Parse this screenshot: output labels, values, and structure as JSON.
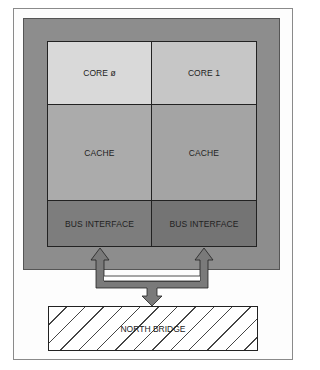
{
  "diagram": {
    "cores": [
      {
        "core_label": "CORE ø",
        "cache_label": "CACHE",
        "bus_label": "BUS INTERFACE"
      },
      {
        "core_label": "CORE 1",
        "cache_label": "CACHE",
        "bus_label": "BUS INTERFACE"
      }
    ],
    "north_bridge_label": "NORTH BRIDGE",
    "colors": {
      "chip_bg": "#8d8d8d",
      "core0": "#d9d9d9",
      "core1": "#c6c6c6",
      "cache0": "#ababab",
      "cache1": "#a4a4a4",
      "bus0": "#7d7d7d",
      "bus1": "#747474",
      "arrow": "#7a7a7a"
    }
  }
}
